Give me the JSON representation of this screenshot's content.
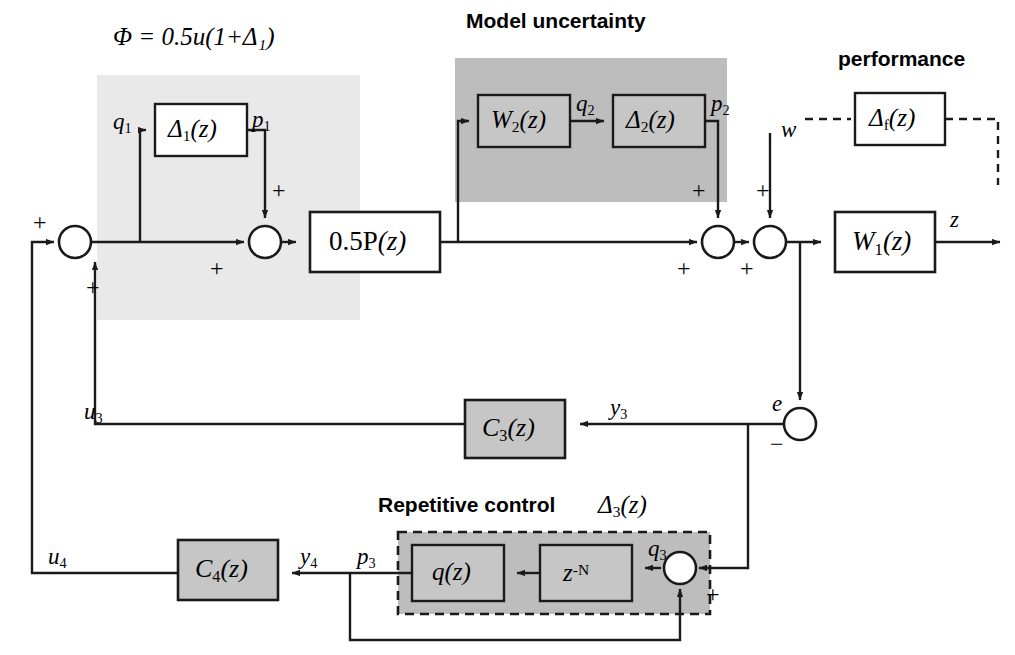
{
  "diagram": {
    "title_phi": "Φ = 0.5u(1+Δ₁)",
    "heading_model_uncertainty": "Model uncertainty",
    "heading_performance": "performance",
    "heading_repetitive_control": "Repetitive control",
    "bg_light": "#e9e9e9",
    "bg_dark": "#bdbdbd",
    "block_fill_gray": "#c6c6c6",
    "block_fill_white": "#ffffff",
    "line_color": "#1a1a1a"
  },
  "blocks": {
    "delta1": {
      "base": "Δ",
      "sub": "1",
      "tail": "(z)"
    },
    "w2": {
      "base": "W",
      "sub": "2",
      "tail": "(z)"
    },
    "delta2": {
      "base": "Δ",
      "sub": "2",
      "tail": "(z)"
    },
    "deltaf": {
      "base": "Δ",
      "sub": "f",
      "tail": "(z)"
    },
    "plant": {
      "base": "0.5P",
      "sub": "",
      "tail": "(z)"
    },
    "w1": {
      "base": "W",
      "sub": "1",
      "tail": "(z)"
    },
    "c3": {
      "base": "C",
      "sub": "3",
      "tail": "(z)"
    },
    "c4": {
      "base": "C",
      "sub": "4",
      "tail": "(z)"
    },
    "q": {
      "base": "q",
      "sub": "",
      "tail": "(z)"
    },
    "delay": {
      "base": "z",
      "sup": "-N",
      "tail": ""
    },
    "delta3": {
      "base": "Δ",
      "sub": "3",
      "tail": "(z)"
    }
  },
  "signals": {
    "q1": {
      "base": "q",
      "sub": "1"
    },
    "p1": {
      "base": "p",
      "sub": "1"
    },
    "q2": {
      "base": "q",
      "sub": "2"
    },
    "p2": {
      "base": "p",
      "sub": "2"
    },
    "q3": {
      "base": "q",
      "sub": "3"
    },
    "p3": {
      "base": "p",
      "sub": "3"
    },
    "y3": {
      "base": "y",
      "sub": "3"
    },
    "y4": {
      "base": "y",
      "sub": "4"
    },
    "u3": {
      "base": "u",
      "sub": "3"
    },
    "u4": {
      "base": "u",
      "sub": "4"
    },
    "w": {
      "base": "w",
      "sub": ""
    },
    "z": {
      "base": "z",
      "sub": ""
    },
    "e": {
      "base": "e",
      "sub": ""
    }
  },
  "signs": {
    "plus": "+",
    "minus": "−"
  }
}
